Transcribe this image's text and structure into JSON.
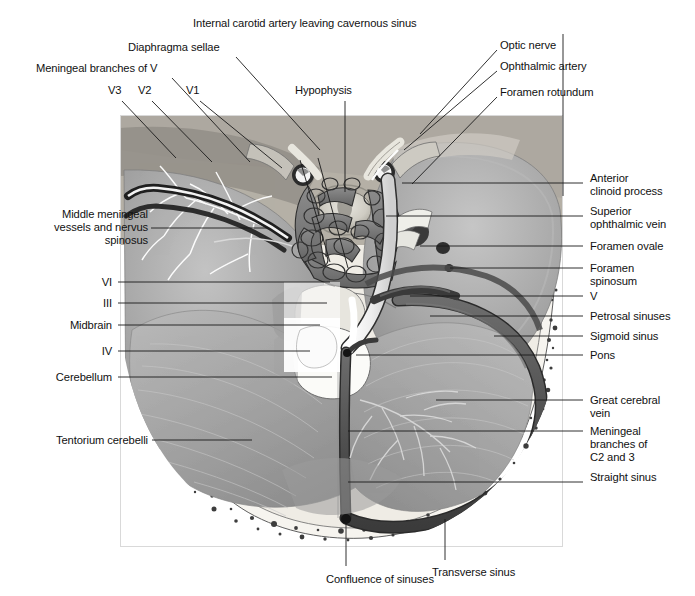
{
  "figure": {
    "type": "anatomical-illustration",
    "image_area": {
      "x": 120,
      "y": 115,
      "width": 443,
      "height": 432
    }
  },
  "colors": {
    "background": "#ffffff",
    "text": "#111111",
    "leader_line": "#1a1a1a",
    "bone_light": "#efece6",
    "bone_mid": "#d8d3c9",
    "brain_mid": "#a9a9a9",
    "brain_dark": "#8a8a8a",
    "brain_light": "#c4c4c4",
    "sinus_dark": "#5a5a5a",
    "sinus_darkest": "#3c3c3c",
    "artery_white": "#f2f2f2",
    "cavernous": "#6e6e6e",
    "tentorium": "#b3b3b3",
    "diploe": "#f5f3ee"
  },
  "labels": {
    "top": [
      {
        "id": "internal-carotid-artery",
        "text": "Internal carotid artery leaving cavernous sinus",
        "x": 193,
        "y": 23,
        "anchor": "start",
        "leader": [
          [
            563,
            34
          ],
          [
            563,
            34
          ]
        ]
      },
      {
        "id": "diaphragma-sellae",
        "text": "Diaphragma sellae",
        "x": 128,
        "y": 47,
        "anchor": "start",
        "leader": [
          [
            236,
            57
          ],
          [
            320,
            148
          ]
        ]
      },
      {
        "id": "meningeal-branches-of-v",
        "text": "Meningeal branches of V",
        "x": 36,
        "y": 68,
        "anchor": "start",
        "leader": [
          [
            172,
            78
          ],
          [
            236,
            150
          ]
        ]
      },
      {
        "id": "optic-nerve",
        "text": "Optic nerve",
        "x": 500,
        "y": 45,
        "anchor": "start",
        "leader": [
          [
            497,
            52
          ],
          [
            420,
            135
          ]
        ]
      },
      {
        "id": "ophthalmic-artery",
        "text": "Ophthalmic artery",
        "x": 500,
        "y": 66,
        "anchor": "start",
        "leader": [
          [
            497,
            72
          ],
          [
            405,
            148
          ]
        ]
      },
      {
        "id": "foramen-rotundum",
        "text": "Foramen rotundum",
        "x": 500,
        "y": 92,
        "anchor": "start",
        "leader": [
          [
            497,
            98
          ],
          [
            412,
            183
          ]
        ]
      },
      {
        "id": "v3",
        "text": "V3",
        "x": 108,
        "y": 89,
        "anchor": "start",
        "leader": [
          [
            122,
            100
          ],
          [
            168,
            148
          ]
        ]
      },
      {
        "id": "v2",
        "text": "V2",
        "x": 138,
        "y": 89,
        "anchor": "start",
        "leader": [
          [
            152,
            100
          ],
          [
            200,
            150
          ]
        ]
      },
      {
        "id": "v1",
        "text": "V1",
        "x": 186,
        "y": 89,
        "anchor": "start",
        "leader": [
          [
            200,
            100
          ],
          [
            268,
            150
          ]
        ]
      },
      {
        "id": "hypophysis",
        "text": "Hypophysis",
        "x": 295,
        "y": 89,
        "anchor": "start",
        "leader": [
          [
            345,
            100
          ],
          [
            345,
            205
          ]
        ]
      }
    ],
    "left": [
      {
        "id": "middle-meningeal-vessels",
        "text": "Middle meningeal\nvessels and nervus\nspinosus",
        "lines": [
          "Middle meningeal",
          "vessels and nervus",
          "spinosus"
        ],
        "x": 148,
        "y": 222,
        "anchor": "end",
        "leader": [
          [
            151,
            228
          ],
          [
            268,
            228
          ]
        ]
      },
      {
        "id": "vi",
        "text": "VI",
        "x": 112,
        "y": 282,
        "anchor": "end",
        "leader": [
          [
            118,
            282
          ],
          [
            330,
            282
          ]
        ]
      },
      {
        "id": "iii",
        "text": "III",
        "x": 112,
        "y": 303,
        "anchor": "end",
        "leader": [
          [
            118,
            303
          ],
          [
            327,
            303
          ]
        ]
      },
      {
        "id": "midbrain",
        "text": "Midbrain",
        "x": 112,
        "y": 325,
        "anchor": "end",
        "leader": [
          [
            118,
            325
          ],
          [
            320,
            325
          ]
        ]
      },
      {
        "id": "iv",
        "text": "IV",
        "x": 112,
        "y": 351,
        "anchor": "end",
        "leader": [
          [
            118,
            351
          ],
          [
            310,
            351
          ]
        ]
      },
      {
        "id": "cerebellum",
        "text": "Cerebellum",
        "x": 112,
        "y": 377,
        "anchor": "end",
        "leader": [
          [
            118,
            377
          ],
          [
            332,
            377
          ]
        ]
      },
      {
        "id": "tentorium-cerebelli",
        "text": "Tentorium cerebelli",
        "x": 148,
        "y": 440,
        "anchor": "end",
        "leader": [
          [
            152,
            440
          ],
          [
            252,
            440
          ]
        ]
      }
    ],
    "right": [
      {
        "id": "anterior-clinoid-process",
        "text": "Anterior\nclinoid process",
        "lines": [
          "Anterior",
          "clinoid process"
        ],
        "x": 590,
        "y": 178,
        "anchor": "start",
        "leader": [
          [
            565,
            183
          ],
          [
            583,
            183
          ]
        ]
      },
      {
        "id": "superior-ophthalmic-vein",
        "text": "Superior\nophthalmic vein",
        "lines": [
          "Superior",
          "ophthalmic vein"
        ],
        "x": 590,
        "y": 211,
        "anchor": "start",
        "leader": [
          [
            565,
            216
          ],
          [
            583,
            216
          ]
        ]
      },
      {
        "id": "foramen-ovale",
        "text": "Foramen ovale",
        "x": 590,
        "y": 241,
        "anchor": "start",
        "leader": [
          [
            565,
            246
          ],
          [
            583,
            246
          ]
        ]
      },
      {
        "id": "foramen-spinosum",
        "text": "Foramen\nspinosum",
        "lines": [
          "Foramen",
          "spinosum"
        ],
        "x": 590,
        "y": 263,
        "anchor": "start",
        "leader": [
          [
            565,
            268
          ],
          [
            583,
            268
          ]
        ]
      },
      {
        "id": "v",
        "text": "V",
        "x": 590,
        "y": 291,
        "anchor": "start",
        "leader": [
          [
            565,
            296
          ],
          [
            583,
            296
          ]
        ]
      },
      {
        "id": "petrosal-sinuses",
        "text": "Petrosal sinuses",
        "x": 590,
        "y": 311,
        "anchor": "start",
        "leader": [
          [
            565,
            316
          ],
          [
            583,
            316
          ]
        ]
      },
      {
        "id": "sigmoid-sinus",
        "text": "Sigmoid sinus",
        "x": 590,
        "y": 331,
        "anchor": "start",
        "leader": [
          [
            565,
            336
          ],
          [
            583,
            336
          ]
        ]
      },
      {
        "id": "pons",
        "text": "Pons",
        "x": 590,
        "y": 350,
        "anchor": "start",
        "leader": [
          [
            565,
            355
          ],
          [
            583,
            355
          ]
        ]
      },
      {
        "id": "great-cerebral-vein",
        "text": "Great cerebral\nvein",
        "lines": [
          "Great cerebral",
          "vein"
        ],
        "x": 590,
        "y": 395,
        "anchor": "start",
        "leader": [
          [
            565,
            400
          ],
          [
            583,
            400
          ]
        ]
      },
      {
        "id": "meningeal-branches-c2-c3",
        "text": "Meningeal\nbranches of\nC2 and 3",
        "lines": [
          "Meningeal",
          "branches of",
          "C2 and 3"
        ],
        "x": 590,
        "y": 426,
        "anchor": "start",
        "leader": [
          [
            565,
            431
          ],
          [
            583,
            431
          ]
        ]
      },
      {
        "id": "straight-sinus",
        "text": "Straight sinus",
        "x": 590,
        "y": 477,
        "anchor": "start",
        "leader": [
          [
            565,
            482
          ],
          [
            583,
            482
          ]
        ]
      }
    ],
    "bottom": [
      {
        "id": "confluence-of-sinuses",
        "text": "Confluence of sinuses",
        "x": 326,
        "y": 579,
        "anchor": "start",
        "leader": [
          [
            346,
            521
          ],
          [
            346,
            566
          ]
        ]
      },
      {
        "id": "transverse-sinus",
        "text": "Transverse sinus",
        "x": 432,
        "y": 572,
        "anchor": "start",
        "leader": [
          [
            445,
            520
          ],
          [
            445,
            560
          ]
        ]
      }
    ]
  }
}
